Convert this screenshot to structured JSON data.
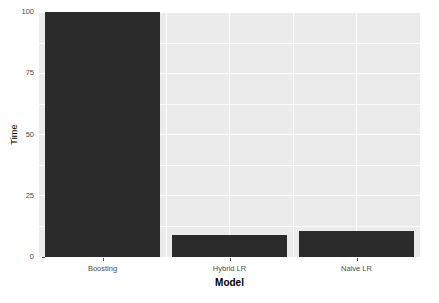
{
  "chart_data": {
    "type": "bar",
    "title": "",
    "subtitle": "",
    "xlabel": "Model",
    "ylabel": "Time",
    "categories": [
      "Boosting",
      "Hybrid LR",
      "Naive LR"
    ],
    "values": [
      100,
      9,
      10.5
    ],
    "series": [
      {
        "name": "Time",
        "values": [
          100,
          9,
          10.5
        ]
      }
    ],
    "ylim": [
      0,
      100
    ],
    "y_ticks": [
      0,
      25,
      50,
      75,
      100
    ],
    "y_tick_labels": [
      "0",
      "25",
      "50",
      "75",
      "100"
    ],
    "y_minor_ticks": [
      12.5,
      37.5,
      62.5,
      87.5
    ],
    "grid": true,
    "legend": "none",
    "bar_color": "#2b2b2b",
    "panel_color": "#ebebeb",
    "gridline_color": "#ffffff",
    "axis_text_color": "#4d4d4d",
    "background_color": "#ffffff"
  },
  "axes": {
    "y_title": "Time",
    "x_title": "Model"
  }
}
